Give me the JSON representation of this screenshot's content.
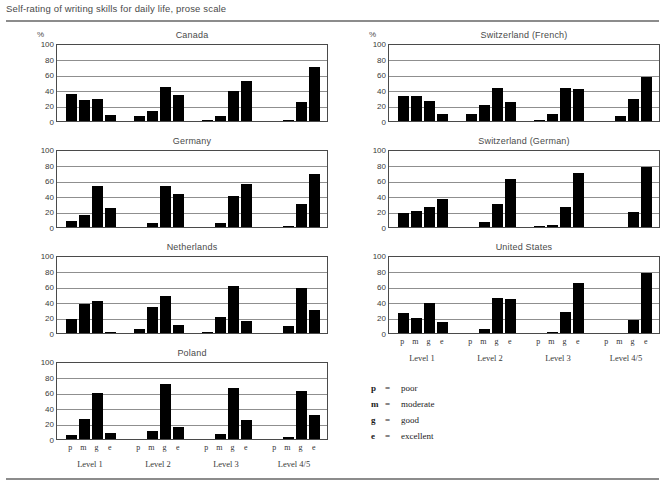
{
  "figure": {
    "title": "Self-rating of writing  skills for daily life, prose scale",
    "axis_unit_label": "%"
  },
  "legend": {
    "equals": "=",
    "items": [
      {
        "key": "p",
        "label": "poor"
      },
      {
        "key": "m",
        "label": "moderate"
      },
      {
        "key": "g",
        "label": "good"
      },
      {
        "key": "e",
        "label": "excellent"
      }
    ]
  },
  "axis": {
    "yticks": [
      0,
      20,
      40,
      60,
      80,
      100
    ],
    "group_labels": [
      "Level 1",
      "Level 2",
      "Level 3",
      "Level 4/5"
    ],
    "bar_labels": [
      "p",
      "m",
      "g",
      "e"
    ]
  },
  "chart_data": {
    "type": "bar",
    "title": "Self-rating of writing  skills for daily life, prose scale",
    "xlabel": "",
    "ylabel": "%",
    "ylim": [
      0,
      100
    ],
    "grid": true,
    "legend_position": "below-right",
    "categories": [
      "Level 1",
      "Level 2",
      "Level 3",
      "Level 4/5"
    ],
    "subcategories": [
      "p",
      "m",
      "g",
      "e"
    ],
    "subcategory_names": [
      "poor",
      "moderate",
      "good",
      "excellent"
    ],
    "panels": [
      {
        "title": "Canada",
        "column": "left",
        "row": 1,
        "values": {
          "Level 1": [
            35,
            27,
            28,
            8
          ],
          "Level 2": [
            6,
            13,
            44,
            33
          ],
          "Level 3": [
            1,
            7,
            39,
            51
          ],
          "Level 4/5": [
            0,
            1,
            25,
            69
          ]
        }
      },
      {
        "title": "Germany",
        "column": "left",
        "row": 2,
        "values": {
          "Level 1": [
            8,
            16,
            52,
            25
          ],
          "Level 2": [
            0,
            5,
            52,
            42
          ],
          "Level 3": [
            0,
            5,
            40,
            55
          ],
          "Level 4/5": [
            0,
            1,
            29,
            68
          ]
        }
      },
      {
        "title": "Netherlands",
        "column": "left",
        "row": 3,
        "values": {
          "Level 1": [
            18,
            37,
            41,
            1
          ],
          "Level 2": [
            5,
            33,
            48,
            10
          ],
          "Level 3": [
            1,
            21,
            60,
            15
          ],
          "Level 4/5": [
            0,
            9,
            58,
            29
          ]
        }
      },
      {
        "title": "Poland",
        "column": "left",
        "row": 4,
        "values": {
          "Level 1": [
            5,
            26,
            59,
            8
          ],
          "Level 2": [
            0,
            10,
            71,
            15
          ],
          "Level 3": [
            0,
            6,
            65,
            25
          ],
          "Level 4/5": [
            0,
            2,
            62,
            31
          ]
        }
      },
      {
        "title": "Switzerland (French)",
        "column": "right",
        "row": 1,
        "values": {
          "Level 1": [
            32,
            32,
            26,
            9
          ],
          "Level 2": [
            9,
            21,
            42,
            24
          ],
          "Level 3": [
            1,
            9,
            42,
            41
          ],
          "Level 4/5": [
            0,
            7,
            28,
            57
          ]
        }
      },
      {
        "title": "Switzerland (German)",
        "column": "right",
        "row": 2,
        "values": {
          "Level 1": [
            18,
            21,
            26,
            36
          ],
          "Level 2": [
            0,
            7,
            29,
            62
          ],
          "Level 3": [
            1,
            2,
            26,
            69
          ],
          "Level 4/5": [
            0,
            0,
            19,
            77
          ]
        }
      },
      {
        "title": "United States",
        "column": "right",
        "row": 3,
        "values": {
          "Level 1": [
            26,
            19,
            39,
            14
          ],
          "Level 2": [
            0,
            5,
            45,
            44
          ],
          "Level 3": [
            0,
            1,
            27,
            64
          ],
          "Level 4/5": [
            0,
            0,
            17,
            77
          ]
        }
      }
    ]
  },
  "colors": {
    "bar": "#000000",
    "frame": "#4a4a4a",
    "grid": "#8f8f8f",
    "title_text": "#4a4a4a",
    "rule": "#8c8c8c"
  }
}
